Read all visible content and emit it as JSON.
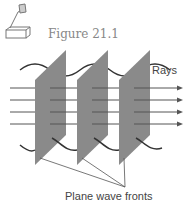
{
  "figure": {
    "label": "Figure 21.1",
    "icon": "overhead-projector-icon"
  },
  "diagram": {
    "rays_label": "Rays",
    "fronts_label": "Plane wave fronts",
    "ray_count": 4,
    "plane_count": 3,
    "colors": {
      "plane": "#8a8a8a",
      "line": "#555555",
      "wave": "#333333"
    }
  }
}
